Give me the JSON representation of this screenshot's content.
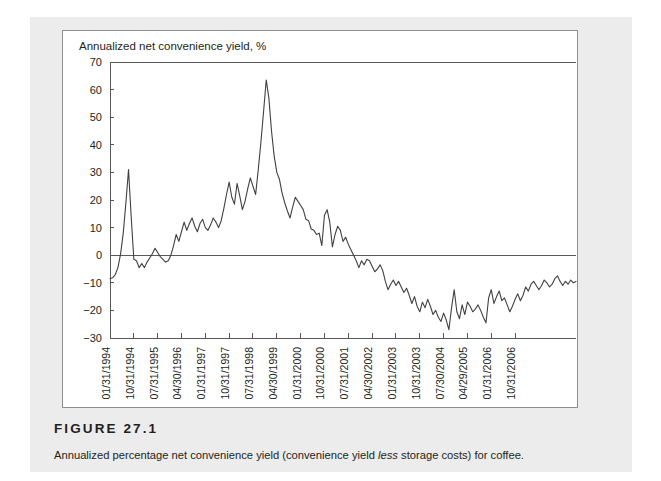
{
  "figure": {
    "number_label": "FIGURE  27.1",
    "caption_before": "Annualized percentage net convenience yield (convenience yield ",
    "caption_emphasis": "less",
    "caption_after": " storage costs) for coffee."
  },
  "colors": {
    "page_background": "#ffffff",
    "panel_background": "#ececec",
    "chart_background": "#ffffff",
    "axis": "#58595b",
    "series_line": "#414042",
    "text": "#231f20",
    "card_border": "#8d8d8d"
  },
  "chart_data": {
    "type": "line",
    "title": "",
    "axis_title": "Annualized net convenience yield, %",
    "xlabel": "",
    "ylabel": "Annualized net convenience yield, %",
    "ylim": [
      -30,
      70
    ],
    "yticks": [
      70,
      60,
      50,
      40,
      30,
      20,
      10,
      0,
      -10,
      -20,
      -30
    ],
    "ytick_labels": [
      "70",
      "60",
      "50",
      "40",
      "30",
      "20",
      "10",
      "0",
      "−10",
      "−20",
      "−30"
    ],
    "grid": false,
    "legend": "none",
    "zero_reference_line": 0,
    "xtick_labels": [
      "01/31/1994",
      "10/31/1994",
      "07/31/1995",
      "04/30/1996",
      "01/31/1997",
      "10/31/1997",
      "07/31/1998",
      "04/30/1999",
      "01/31/2000",
      "10/31/2000",
      "07/31/2001",
      "04/30/2002",
      "01/31/2003",
      "10/31/2003",
      "07/30/2004",
      "04/29/2005",
      "01/31/2006",
      "10/31/2006"
    ],
    "xtick_interval_months": 9,
    "series": [
      {
        "name": "Annualized net convenience yield",
        "values": [
          -8.5,
          -8.2,
          -7.0,
          -4.5,
          0.5,
          8.0,
          19.0,
          31.0,
          14.0,
          -1.5,
          -2.0,
          -4.5,
          -3.0,
          -4.5,
          -2.5,
          -1.0,
          0.5,
          2.5,
          1.0,
          -0.5,
          -1.5,
          -2.5,
          -2.0,
          0.0,
          3.5,
          7.5,
          5.0,
          8.5,
          12.0,
          9.0,
          11.5,
          13.5,
          10.5,
          8.5,
          11.5,
          13.0,
          10.0,
          9.0,
          11.0,
          13.5,
          12.0,
          10.0,
          12.5,
          17.0,
          22.0,
          26.5,
          21.0,
          18.5,
          26.0,
          21.5,
          16.5,
          19.5,
          24.0,
          28.0,
          25.0,
          22.0,
          31.0,
          41.0,
          52.0,
          63.5,
          57.0,
          45.0,
          36.0,
          30.0,
          27.5,
          22.5,
          19.0,
          16.0,
          13.5,
          17.5,
          21.0,
          19.5,
          18.0,
          16.5,
          13.0,
          12.5,
          9.5,
          9.0,
          7.5,
          8.0,
          3.5,
          14.5,
          16.5,
          12.0,
          3.0,
          7.5,
          10.5,
          9.0,
          5.0,
          6.5,
          4.0,
          2.0,
          0.0,
          -2.0,
          -4.5,
          -2.0,
          -3.5,
          -1.5,
          -2.0,
          -4.0,
          -6.0,
          -5.0,
          -3.5,
          -5.5,
          -9.5,
          -12.5,
          -10.5,
          -9.0,
          -11.0,
          -9.5,
          -11.5,
          -13.5,
          -12.0,
          -14.5,
          -17.5,
          -15.0,
          -18.5,
          -20.5,
          -17.0,
          -19.0,
          -16.0,
          -18.5,
          -21.5,
          -20.0,
          -22.5,
          -24.0,
          -21.0,
          -23.5,
          -27.0,
          -19.0,
          -12.5,
          -20.5,
          -23.0,
          -18.0,
          -21.5,
          -17.0,
          -18.5,
          -20.5,
          -19.5,
          -18.0,
          -20.0,
          -22.5,
          -24.5,
          -15.5,
          -12.5,
          -17.5,
          -15.0,
          -13.0,
          -16.5,
          -15.5,
          -18.0,
          -20.5,
          -18.5,
          -16.0,
          -14.0,
          -16.5,
          -14.5,
          -11.5,
          -13.0,
          -10.5,
          -9.5,
          -11.0,
          -12.5,
          -11.0,
          -9.0,
          -10.0,
          -11.5,
          -10.5,
          -8.5,
          -7.5,
          -9.5,
          -11.0,
          -9.5,
          -10.5,
          -9.0,
          -10.0,
          -9.5
        ]
      }
    ]
  }
}
